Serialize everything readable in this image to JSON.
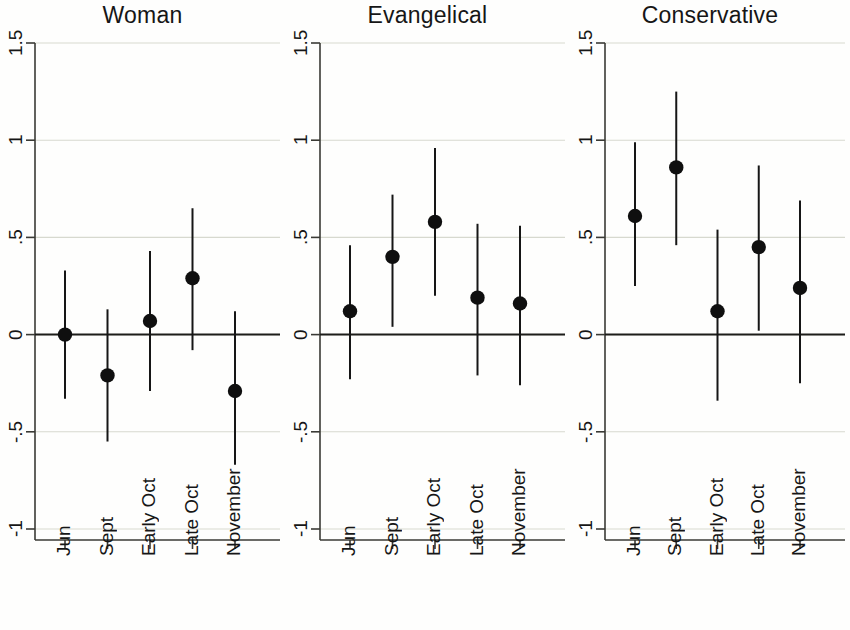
{
  "figure": {
    "width": 850,
    "height": 630,
    "background_color": "#fefefd",
    "line_color": "#161616",
    "grid_color": "#d7d9cf"
  },
  "chart_data": {
    "type": "scatter",
    "title": "",
    "xlabel": "",
    "ylabel": "",
    "ylim": [
      -1,
      1.5
    ],
    "yticks": [
      1.5,
      1,
      0.5,
      0,
      -0.5,
      -1
    ],
    "ytick_labels": [
      "1.5",
      "1",
      ".5",
      "0",
      "-.5",
      "-1"
    ],
    "grid": true,
    "legend": "none",
    "zero_reference_line": 0,
    "categories": [
      "Jun",
      "Sept",
      "Early Oct",
      "Late Oct",
      "November"
    ],
    "panels": [
      {
        "title": "Woman",
        "values": [
          0.0,
          -0.21,
          0.07,
          0.29,
          -0.29
        ],
        "ci_low": [
          -0.33,
          -0.55,
          -0.29,
          -0.08,
          -0.67
        ],
        "ci_high": [
          0.33,
          0.13,
          0.43,
          0.65,
          0.12
        ]
      },
      {
        "title": "Evangelical",
        "values": [
          0.12,
          0.4,
          0.58,
          0.19,
          0.16
        ],
        "ci_low": [
          -0.23,
          0.04,
          0.2,
          -0.21,
          -0.26
        ],
        "ci_high": [
          0.46,
          0.72,
          0.96,
          0.57,
          0.56
        ]
      },
      {
        "title": "Conservative",
        "values": [
          0.61,
          0.86,
          0.12,
          0.45,
          0.24
        ],
        "ci_low": [
          0.25,
          0.46,
          -0.34,
          0.02,
          -0.25
        ],
        "ci_high": [
          0.99,
          1.25,
          0.54,
          0.87,
          0.69
        ]
      }
    ]
  }
}
